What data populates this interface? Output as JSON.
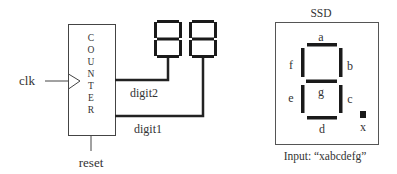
{
  "counter": {
    "letters": [
      "C",
      "O",
      "U",
      "N",
      "T",
      "E",
      "R"
    ],
    "label": "COUNTER"
  },
  "inputs": {
    "clk": "clk",
    "reset": "reset"
  },
  "outputs": {
    "digit2": "digit2",
    "digit1": "digit1"
  },
  "ssd": {
    "title": "SSD",
    "segments": {
      "a": "a",
      "b": "b",
      "c": "c",
      "d": "d",
      "e": "e",
      "f": "f",
      "g": "g",
      "x": "x"
    },
    "input_caption": "Input: “xabcdefg”"
  },
  "colors": {
    "line": "#222222",
    "segment": "#1a1a1a",
    "box": "#555555",
    "text": "#333333"
  }
}
